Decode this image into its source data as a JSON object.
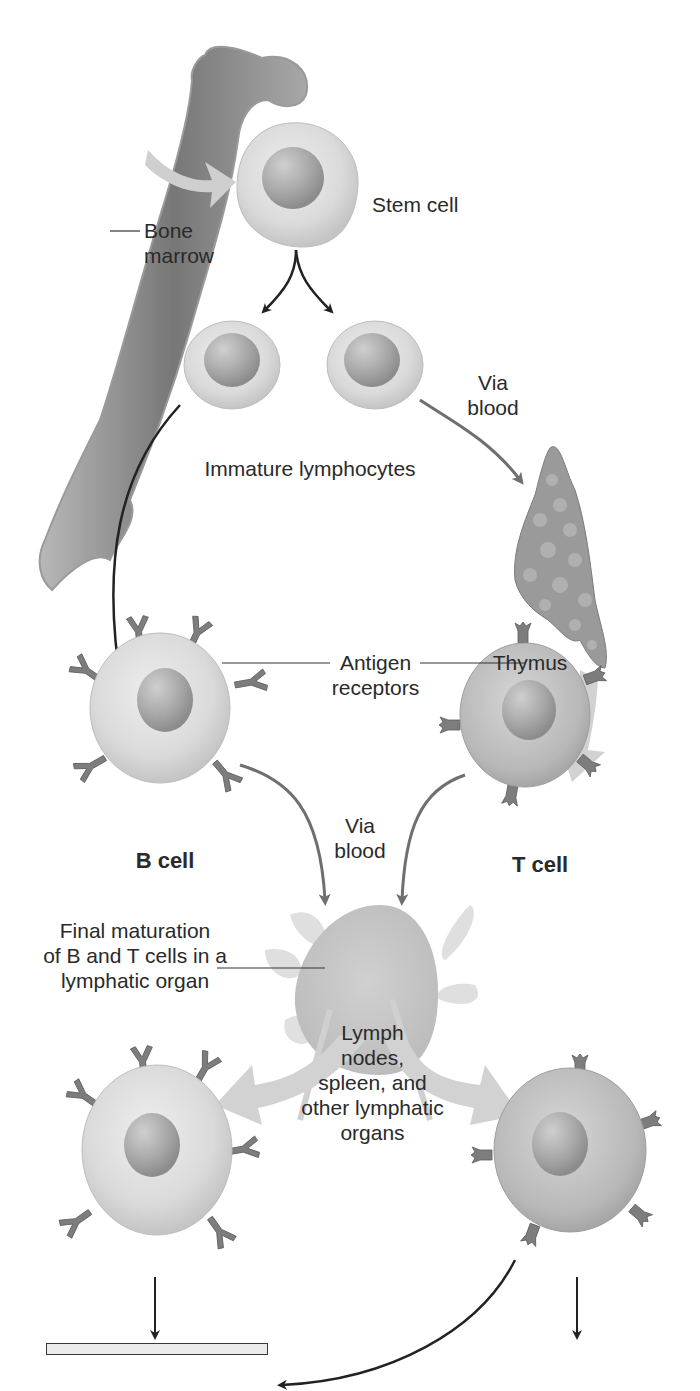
{
  "diagram": {
    "labels": {
      "stem_cell": "Stem cell",
      "bone_marrow": "Bone\nmarrow",
      "immature_lymphocytes": "Immature lymphocytes",
      "via_blood_top": "Via\nblood",
      "thymus": "Thymus",
      "antigen_receptors": "Antigen\nreceptors",
      "b_cell": "B cell",
      "t_cell": "T cell",
      "via_blood_mid": "Via\nblood",
      "final_maturation": "Final maturation\nof B and T cells in a\nlymphatic organ",
      "lymph_organs": "Lymph\nnodes,\nspleen, and\nother lymphatic\norgans"
    },
    "responses": [
      {
        "title": "Humoral\nimmune response:",
        "description": "action against free-\nfloating antigens"
      },
      {
        "title": "Cell-mediated\nimmune response:",
        "description": "action against\ninfected cells"
      }
    ],
    "colors": {
      "cell_fill": "#d9d9d9",
      "nucleus_fill": "#a8a8a8",
      "t_cell_fill": "#b9b9b9",
      "receptor_fill": "#7a7a7a",
      "bone_fill": "#8a8a8a",
      "light_arrow": "#cfcfcf",
      "dark_arrow": "#222222",
      "gray_arrow": "#6f6f6f",
      "box_fill": "#ececec"
    }
  }
}
